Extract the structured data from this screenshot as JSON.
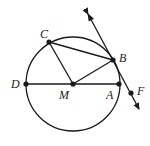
{
  "diagram": {
    "type": "circle-geometry",
    "stroke_color": "#1a1a1a",
    "background": "#ffffff",
    "circle": {
      "center_label": "M",
      "cx": 73,
      "cy": 84,
      "r": 47
    },
    "points": [
      {
        "label": "C",
        "x": 49,
        "y": 42,
        "lx": 40,
        "ly": 38
      },
      {
        "label": "B",
        "x": 113,
        "y": 60,
        "lx": 119,
        "ly": 62
      },
      {
        "label": "D",
        "x": 26,
        "y": 84,
        "lx": 11,
        "ly": 88
      },
      {
        "label": "M",
        "x": 73,
        "y": 84,
        "lx": 59,
        "ly": 99
      },
      {
        "label": "A",
        "x": 119,
        "y": 84,
        "lx": 106,
        "ly": 99
      },
      {
        "label": "F",
        "x": 131,
        "y": 93,
        "lx": 137,
        "ly": 95
      }
    ],
    "segments": [
      {
        "from": "D",
        "to": "A"
      },
      {
        "from": "M",
        "to": "C"
      },
      {
        "from": "M",
        "to": "B"
      },
      {
        "from": "C",
        "to": "B"
      }
    ],
    "tangent_line": {
      "through": [
        "B",
        "F"
      ],
      "x1": 88,
      "y1": 14,
      "x2": 139,
      "y2": 109,
      "arrows": "both"
    }
  }
}
